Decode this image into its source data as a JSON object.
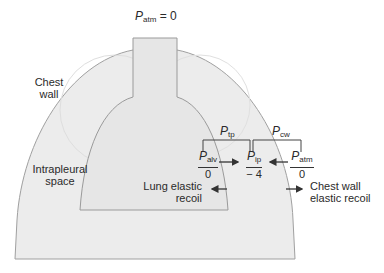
{
  "title": {
    "symbol": "P",
    "subscript": "atm",
    "suffix": " = 0"
  },
  "labels": {
    "chest_wall": [
      "Chest",
      "wall"
    ],
    "intrapleural_space": [
      "Intrapleural",
      "space"
    ],
    "lung_elastic_recoil": [
      "Lung elastic",
      "recoil"
    ],
    "chest_wall_elastic_recoil": [
      "Chest wall",
      "elastic recoil"
    ]
  },
  "brackets": {
    "transpulmonary": {
      "symbol": "P",
      "subscript": "tp"
    },
    "chest_wall": {
      "symbol": "P",
      "subscript": "cw"
    }
  },
  "pressures": [
    {
      "symbol": "P",
      "subscript": "alv",
      "value": "0"
    },
    {
      "symbol": "P",
      "subscript": "ip",
      "value": "− 4"
    },
    {
      "symbol": "P",
      "subscript": "atm",
      "value": "0"
    }
  ],
  "colors": {
    "chest_fill": "#ebebeb",
    "lung_fill": "#e4e4e4",
    "outline": "#9a9a9a",
    "line": "#333333"
  }
}
